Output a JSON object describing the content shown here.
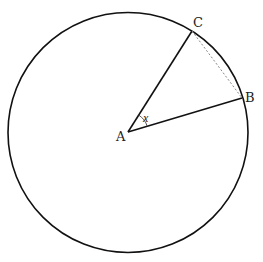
{
  "diagram": {
    "type": "circle-sector",
    "colors": {
      "stroke": "#111111",
      "chord": "#888888",
      "background": "#ffffff"
    },
    "circle": {
      "cx": 128,
      "cy": 132.5,
      "r": 120
    },
    "points": {
      "A": {
        "label": "A",
        "x": 128,
        "y": 132
      },
      "B": {
        "label": "B",
        "x": 242,
        "y": 98
      },
      "C": {
        "label": "C",
        "x": 192,
        "y": 31
      }
    },
    "angle": {
      "label": "x",
      "vertex": "A",
      "between": [
        "B",
        "C"
      ]
    },
    "segments": [
      {
        "from": "A",
        "to": "B",
        "style": "solid"
      },
      {
        "from": "A",
        "to": "C",
        "style": "solid"
      },
      {
        "from": "B",
        "to": "C",
        "style": "dashed"
      }
    ]
  }
}
